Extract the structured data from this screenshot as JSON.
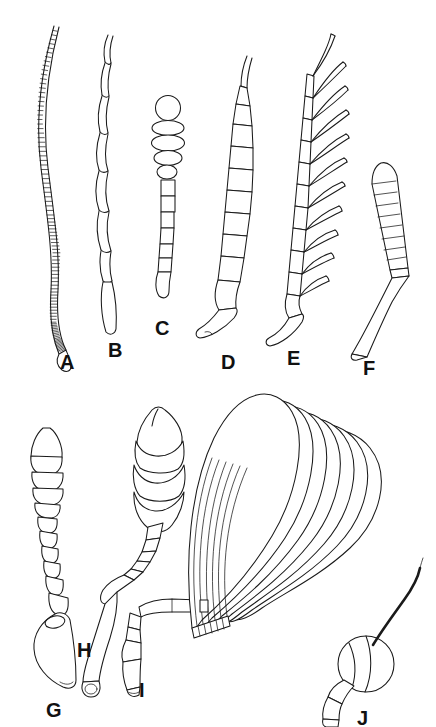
{
  "plate": {
    "title": "Insect antennae types",
    "background_color": "#ffffff",
    "ink_color": "#1a1a1a",
    "style": "black ink line drawing, scientific illustration",
    "width": 436,
    "height": 727,
    "rows": 2,
    "figure_count": 10
  },
  "figures": [
    {
      "id": "A",
      "label": "A",
      "label_x": 60,
      "label_y": 352,
      "name": "filiform-antenna",
      "description": "long slender thread-like antenna, gently S-curved, composed of many narrow ring-like segments, tapering to a blunt basal scape at lower end",
      "segment_count": 95,
      "orientation": "vertical, curving"
    },
    {
      "id": "B",
      "label": "B",
      "label_x": 108,
      "label_y": 340,
      "name": "moniliform-antenna",
      "description": "slender antenna of elongate bead-like segments of increasing length downward, ending in a tapered basal segment",
      "segment_count": 13,
      "orientation": "vertical, slightly wavy"
    },
    {
      "id": "C",
      "label": "C",
      "label_x": 155,
      "label_y": 318,
      "name": "capitate-antenna",
      "description": "straight antenna with small rectangular segments below and an abrupt terminal club formed of flattened discs topped by a round knob",
      "segment_count": 12,
      "orientation": "vertical, straight"
    },
    {
      "id": "D",
      "label": "D",
      "label_x": 221,
      "label_y": 352,
      "name": "serrate-antenna",
      "description": "saw-toothed antenna, each segment triangular and projecting on one side, curving with a hooked basal scape at bottom",
      "segment_count": 12,
      "orientation": "vertical, curved"
    },
    {
      "id": "E",
      "label": "E",
      "label_x": 287,
      "label_y": 348,
      "name": "pectinate-antenna",
      "description": "comb-like antenna, each segment bearing a long curved lateral branch, with a hooked basal scape",
      "segment_count": 11,
      "branch_count": 11,
      "orientation": "vertical, curved"
    },
    {
      "id": "F",
      "label": "F",
      "label_x": 363,
      "label_y": 358,
      "name": "geniculate-antenna",
      "description": "elbowed antenna, long straight basal scape angled sharply into a segmented gradually clubbed flagellum",
      "segment_count": 11,
      "orientation": "elbowed, bent at mid-height"
    },
    {
      "id": "G",
      "label": "G",
      "label_x": 46,
      "label_y": 700,
      "name": "clavate-antenna",
      "description": "club-shaped antenna gradually thickening toward a rounded apical segment, with a broad teardrop scape at the base",
      "segment_count": 11,
      "orientation": "vertical, slightly oblique"
    },
    {
      "id": "H",
      "label": "H",
      "label_x": 77,
      "label_y": 640,
      "name": "lamellate-antenna-club",
      "description": "short geniculate antenna with a large terminal club of three broad overlapping plates and a pointed tip, set on a curved pedicel and elongate scape",
      "lamellae_count": 3,
      "orientation": "elbowed, oblique"
    },
    {
      "id": "I",
      "label": "I",
      "label_x": 139,
      "label_y": 680,
      "name": "geniculate-scape-base",
      "description": "basal scape and pedicel segments of the large lamellate antenna, bent downward to a flared open end",
      "segment_count": 4,
      "orientation": "oblique, downward"
    },
    {
      "id": "J",
      "label": "J",
      "label_x": 357,
      "label_y": 708,
      "name": "aristate-antenna",
      "description": "fly-type antenna with a globular third segment bearing a long tapering bristle (arista) curving upward, on two short basal segments",
      "segment_count": 3,
      "has_arista": true,
      "orientation": "globular with upward arista"
    },
    {
      "id": "LAM",
      "label": "",
      "name": "lamellate-fan",
      "description": "large fan of seven broad, overlapping, leaf-like lamellae radiating from a narrow basal stalk",
      "lamellae_count": 7,
      "orientation": "fan opening to the right"
    }
  ]
}
